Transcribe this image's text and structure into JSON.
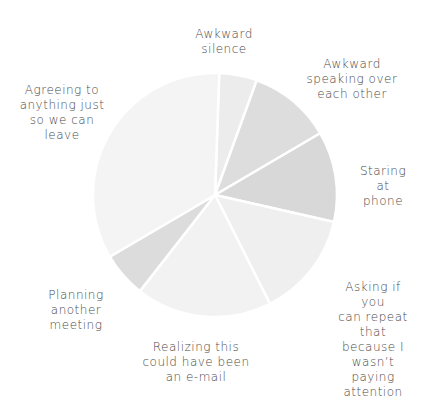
{
  "chart_data": {
    "type": "pie",
    "title": "",
    "start_angle_deg": 2,
    "direction": "clockwise",
    "center": [
      215,
      195
    ],
    "radius": 122,
    "categories": [
      "Awkward silence",
      "Awkward speaking over each other",
      "Staring at phone",
      "Asking if you can repeat that because I wasn't paying attention",
      "Realizing this could have been an e-mail",
      "Planning another meeting",
      "Agreeing to anything just so we can leave"
    ],
    "values": [
      5,
      11,
      12,
      14,
      18,
      6,
      34
    ],
    "colors": [
      "#ececec",
      "#dddddd",
      "#d8d8d8",
      "#efefef",
      "#f2f2f2",
      "#dcdcdc",
      "#f4f4f4"
    ],
    "legend": "none (direct labels)",
    "labels": [
      {
        "text": "Awkward\nsilence",
        "x": 224,
        "y": 27
      },
      {
        "text": "Awkward\nspeaking over\neach other",
        "x": 352,
        "y": 57
      },
      {
        "text": "Staring\nat\nphone",
        "x": 383,
        "y": 164
      },
      {
        "text": "Asking if you\ncan repeat that\nbecause I\nwasn’t paying\nattention",
        "x": 373,
        "y": 280
      },
      {
        "text": "Realizing this\ncould have been\nan e-mail",
        "x": 196,
        "y": 340
      },
      {
        "text": "Planning\nanother\nmeeting",
        "x": 76,
        "y": 288
      },
      {
        "text": "Agreeing to\nanything just\nso we can\nleave",
        "x": 62,
        "y": 83
      }
    ]
  }
}
